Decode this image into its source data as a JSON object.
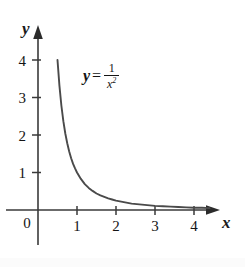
{
  "figure": {
    "background_color": "#ffffff",
    "stroke_color": "#3a3a3a",
    "text_color": "#141414"
  },
  "axes": {
    "x_name": "x",
    "y_name": "y",
    "origin_label": "0",
    "x_ticks": [
      "1",
      "2",
      "3",
      "4"
    ],
    "y_ticks": [
      "1",
      "2",
      "3",
      "4"
    ]
  },
  "equation": {
    "lhs": "y",
    "relation": "=",
    "numerator": "1",
    "denominator_base": "x",
    "denominator_exponent": "2"
  },
  "chart_data": {
    "type": "line",
    "title": "",
    "subtitle": "",
    "xlabel": "x",
    "ylabel": "y",
    "function": "y = 1/x^2",
    "annotations": [
      "y = 1/x²"
    ],
    "legend": [],
    "legend_position": "none",
    "grid": false,
    "xlim": [
      0,
      4.6
    ],
    "ylim": [
      0,
      4.6
    ],
    "xticks": [
      1,
      2,
      3,
      4
    ],
    "yticks": [
      1,
      2,
      3,
      4
    ],
    "x": [
      0.5,
      0.55,
      0.6,
      0.65,
      0.7,
      0.75,
      0.8,
      0.85,
      0.9,
      0.95,
      1.0,
      1.1,
      1.2,
      1.3,
      1.4,
      1.5,
      1.6,
      1.7,
      1.8,
      1.9,
      2.0,
      2.2,
      2.4,
      2.6,
      2.8,
      3.0,
      3.2,
      3.4,
      3.6,
      3.8,
      4.0,
      4.2,
      4.4
    ],
    "y": [
      4.0,
      3.31,
      2.78,
      2.37,
      2.04,
      1.78,
      1.56,
      1.38,
      1.23,
      1.11,
      1.0,
      0.83,
      0.69,
      0.59,
      0.51,
      0.44,
      0.39,
      0.35,
      0.31,
      0.28,
      0.25,
      0.21,
      0.17,
      0.15,
      0.13,
      0.11,
      0.1,
      0.09,
      0.08,
      0.07,
      0.06,
      0.06,
      0.05
    ],
    "series": [
      {
        "name": "y = 1/x^2",
        "values": [
          4.0,
          3.31,
          2.78,
          2.37,
          2.04,
          1.78,
          1.56,
          1.38,
          1.23,
          1.11,
          1.0,
          0.83,
          0.69,
          0.59,
          0.51,
          0.44,
          0.39,
          0.35,
          0.31,
          0.28,
          0.25,
          0.21,
          0.17,
          0.15,
          0.13,
          0.11,
          0.1,
          0.09,
          0.08,
          0.07,
          0.06,
          0.06,
          0.05
        ]
      }
    ]
  }
}
